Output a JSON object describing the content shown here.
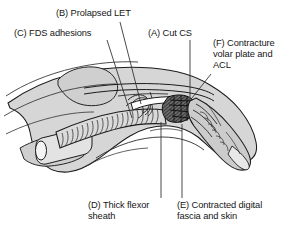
{
  "figure": {
    "type": "medical-illustration",
    "background_color": "#ffffff",
    "ink_color": "#161616",
    "fill_light": "#d8d8d8",
    "fill_mid": "#c2c2c2",
    "fill_dark": "#4a4a4a"
  },
  "annotations": [
    {
      "key": "B",
      "id": "label-b",
      "text": "(B) Prolapsed LET",
      "name": "annotation-b-prolapsed-let",
      "leader": "diagonal-down-right"
    },
    {
      "key": "C",
      "id": "label-c",
      "text": "(C) FDS adhesions",
      "name": "annotation-c-fds-adhesions",
      "leader": "diagonal-down-right"
    },
    {
      "key": "A",
      "id": "label-a",
      "text": "(A) Cut CS",
      "name": "annotation-a-cut-cs",
      "leader": "vertical-down"
    },
    {
      "key": "F",
      "id": "label-f",
      "text": "(F) Contracture\nvolar plate and\nACL",
      "name": "annotation-f-contracture-volar-plate-acl",
      "leader": "diagonal-down-left"
    },
    {
      "key": "D",
      "id": "label-d",
      "text": "(D) Thick flexor\nsheath",
      "name": "annotation-d-thick-flexor-sheath",
      "leader": "vertical-up"
    },
    {
      "key": "E",
      "id": "label-e",
      "text": "(E) Contracted digital\nfascia and skin",
      "name": "annotation-e-contracted-digital-fascia-and-skin",
      "leader": "vertical-up"
    }
  ]
}
